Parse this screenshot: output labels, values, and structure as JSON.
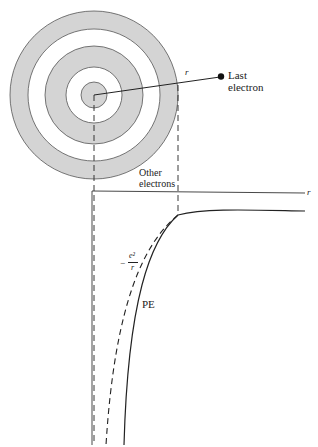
{
  "diagram": {
    "atom": {
      "center": [
        94,
        95
      ],
      "rings": [
        {
          "r": 84,
          "fill": "#d4d4d4"
        },
        {
          "r": 66,
          "fill": "#ffffff"
        },
        {
          "r": 49,
          "fill": "#d4d4d4"
        },
        {
          "r": 28,
          "fill": "#ffffff"
        },
        {
          "r": 13,
          "fill": "#d4d4d4"
        }
      ],
      "radius_label": "r",
      "last_electron_label_line1": "Last",
      "last_electron_label_line2": "electron",
      "other_electrons_line1": "Other",
      "other_electrons_line2": "electrons"
    },
    "graph": {
      "axis_label": "r",
      "curve_dashed_label_num": "e²",
      "curve_dashed_label_den": "r",
      "curve_dashed_label_sign": "−",
      "curve_solid_label": "PE"
    },
    "colors": {
      "ink": "#222222",
      "shade": "#d4d4d4"
    }
  }
}
